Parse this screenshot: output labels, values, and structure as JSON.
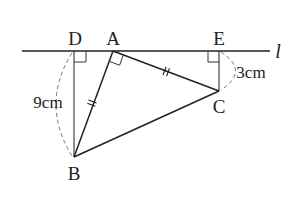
{
  "diagram": {
    "type": "geometry",
    "line_label": "l",
    "points": {
      "D": {
        "label": "D",
        "x": 74,
        "y": 51
      },
      "A": {
        "label": "A",
        "x": 113,
        "y": 51
      },
      "E": {
        "label": "E",
        "x": 219,
        "y": 51
      },
      "B": {
        "label": "B",
        "x": 74,
        "y": 157
      },
      "C": {
        "label": "C",
        "x": 219,
        "y": 91
      }
    },
    "measurements": {
      "BD": "9cm",
      "CE": "3cm"
    },
    "right_angles": [
      "D",
      "A",
      "E"
    ],
    "equal_marks": [
      "AB",
      "AC"
    ],
    "colors": {
      "line": "#222222",
      "dashed": "#777777",
      "text": "#222222"
    }
  }
}
